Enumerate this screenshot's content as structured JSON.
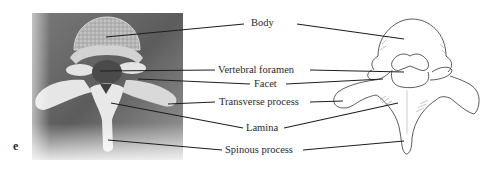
{
  "figure": {
    "panel_letter": "e",
    "subject": "vertebra",
    "left_panel": "photograph",
    "right_panel": "line drawing"
  },
  "labels": [
    {
      "id": "body",
      "text": "Body"
    },
    {
      "id": "vertebral-foramen",
      "text": "Vertebral foramen"
    },
    {
      "id": "facet",
      "text": "Facet"
    },
    {
      "id": "transverse-process",
      "text": "Transverse process"
    },
    {
      "id": "lamina",
      "text": "Lamina"
    },
    {
      "id": "spinous-process",
      "text": "Spinous process"
    }
  ],
  "colors": {
    "leader_line": "#1e1e1e",
    "label_text": "#2a2a2a",
    "drawing_stroke": "#4a4a4a",
    "photo_bg_dark": "#5a5a5a",
    "photo_bg_light": "#c8c8c8",
    "bone_light": "#e6e6e6"
  }
}
